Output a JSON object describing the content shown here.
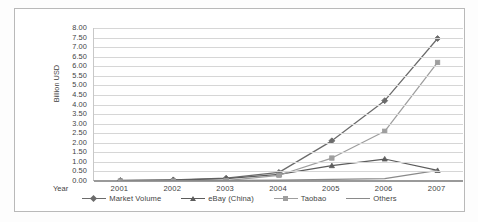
{
  "chart_data": {
    "type": "line",
    "title": "",
    "xlabel": "Year",
    "ylabel": "Billion USD",
    "categories": [
      "2001",
      "2002",
      "2003",
      "2004",
      "2005",
      "2006",
      "2007"
    ],
    "ylim": [
      0,
      8
    ],
    "ytick_step": 0.5,
    "yticks": [
      "8.00",
      "7.50",
      "7.00",
      "6.50",
      "6.00",
      "5.50",
      "5.00",
      "4.50",
      "4.00",
      "3.50",
      "3.00",
      "2.50",
      "2.00",
      "1.50",
      "1.00",
      "0.50",
      "0.00"
    ],
    "grid": true,
    "legend_position": "bottom",
    "series": [
      {
        "name": "Market Volume",
        "marker": "diamond",
        "color": "#6b6b6b",
        "values": [
          0.03,
          0.06,
          0.15,
          0.45,
          2.1,
          4.2,
          7.45
        ]
      },
      {
        "name": "eBay (China)",
        "marker": "triangle",
        "color": "#5c5c5c",
        "values": [
          0.02,
          0.05,
          0.12,
          0.35,
          0.8,
          1.15,
          0.55
        ]
      },
      {
        "name": "Taobao",
        "marker": "square",
        "color": "#9e9e9e",
        "values": [
          0.0,
          0.0,
          0.02,
          0.3,
          1.2,
          2.6,
          6.2
        ]
      },
      {
        "name": "Others",
        "marker": "none",
        "color": "#8a8a8a",
        "values": [
          0.01,
          0.02,
          0.03,
          0.05,
          0.08,
          0.12,
          0.55
        ]
      }
    ]
  }
}
